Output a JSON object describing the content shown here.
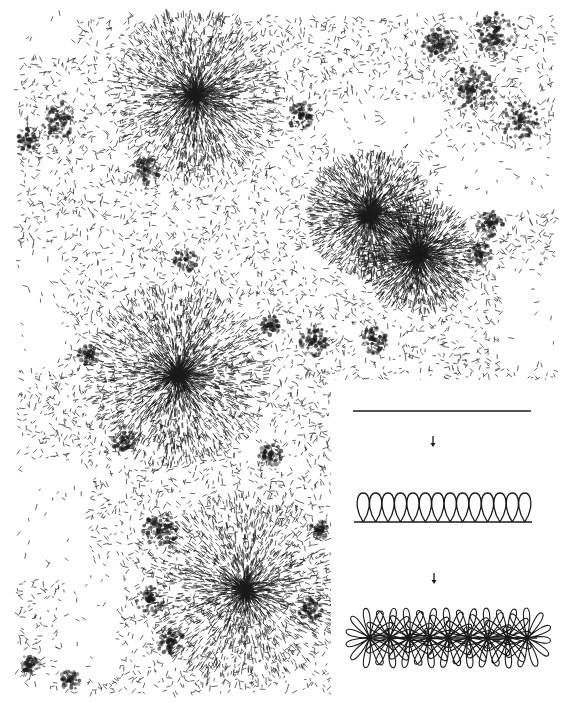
{
  "figure": {
    "type": "electron-micrograph-with-inset-diagram",
    "background": "#ffffff",
    "ink": "#1a1a1a",
    "micrograph": {
      "bounds": {
        "x": 17,
        "y": 15,
        "w": 538,
        "h": 678
      },
      "rosettes": [
        {
          "cx": 195,
          "cy": 95,
          "r": 85,
          "density": 1.0
        },
        {
          "cx": 370,
          "cy": 215,
          "r": 60,
          "density": 0.9
        },
        {
          "cx": 418,
          "cy": 255,
          "r": 55,
          "density": 0.9
        },
        {
          "cx": 178,
          "cy": 375,
          "r": 90,
          "density": 1.1
        },
        {
          "cx": 245,
          "cy": 590,
          "r": 95,
          "density": 0.9
        }
      ],
      "clumps": [
        {
          "cx": 495,
          "cy": 35,
          "r": 22
        },
        {
          "cx": 440,
          "cy": 45,
          "r": 18
        },
        {
          "cx": 470,
          "cy": 90,
          "r": 25
        },
        {
          "cx": 520,
          "cy": 120,
          "r": 20
        },
        {
          "cx": 300,
          "cy": 115,
          "r": 14
        },
        {
          "cx": 60,
          "cy": 120,
          "r": 18
        },
        {
          "cx": 30,
          "cy": 140,
          "r": 12
        },
        {
          "cx": 145,
          "cy": 170,
          "r": 14
        },
        {
          "cx": 185,
          "cy": 260,
          "r": 12
        },
        {
          "cx": 490,
          "cy": 225,
          "r": 14
        },
        {
          "cx": 480,
          "cy": 255,
          "r": 12
        },
        {
          "cx": 88,
          "cy": 355,
          "r": 10
        },
        {
          "cx": 315,
          "cy": 340,
          "r": 16
        },
        {
          "cx": 270,
          "cy": 325,
          "r": 10
        },
        {
          "cx": 375,
          "cy": 340,
          "r": 14
        },
        {
          "cx": 125,
          "cy": 440,
          "r": 14
        },
        {
          "cx": 270,
          "cy": 455,
          "r": 12
        },
        {
          "cx": 160,
          "cy": 530,
          "r": 20
        },
        {
          "cx": 150,
          "cy": 600,
          "r": 14
        },
        {
          "cx": 170,
          "cy": 640,
          "r": 14
        },
        {
          "cx": 30,
          "cy": 665,
          "r": 10
        },
        {
          "cx": 70,
          "cy": 680,
          "r": 10
        },
        {
          "cx": 320,
          "cy": 530,
          "r": 10
        },
        {
          "cx": 310,
          "cy": 610,
          "r": 12
        }
      ],
      "empty_regions": [
        {
          "x": 17,
          "y": 15,
          "w": 60,
          "h": 40
        },
        {
          "x": 330,
          "y": 100,
          "w": 110,
          "h": 50
        },
        {
          "x": 440,
          "y": 150,
          "w": 115,
          "h": 60
        },
        {
          "x": 500,
          "y": 270,
          "w": 55,
          "h": 100
        },
        {
          "x": 17,
          "y": 250,
          "w": 45,
          "h": 120
        },
        {
          "x": 17,
          "y": 460,
          "w": 70,
          "h": 120
        },
        {
          "x": 60,
          "y": 560,
          "w": 60,
          "h": 120
        }
      ]
    },
    "inset": {
      "bounds": {
        "x": 331,
        "y": 380,
        "w": 239,
        "h": 323
      },
      "stages": [
        {
          "name": "straight-fiber",
          "line": {
            "x1": 353,
            "y1": 411,
            "x2": 531,
            "y2": 411
          }
        },
        {
          "name": "arrow-1",
          "x": 433,
          "y1": 436,
          "y2": 447
        },
        {
          "name": "looped-fiber",
          "baseline": {
            "x1": 354,
            "y1": 522,
            "x2": 532
          },
          "loop_count": 14,
          "loop_top": 493,
          "loop_x_start": 357,
          "loop_x_end": 531
        },
        {
          "name": "arrow-2",
          "x": 434,
          "y1": 573,
          "y2": 584
        },
        {
          "name": "rosette-fiber",
          "x_start": 360,
          "x_end": 537,
          "center_y": 638,
          "half_height": 30,
          "node_count": 9
        }
      ]
    }
  }
}
